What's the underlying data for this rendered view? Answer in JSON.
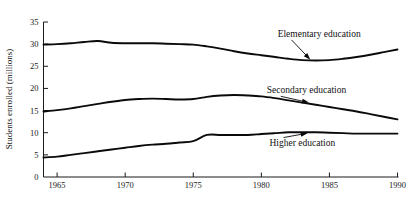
{
  "chart_data": {
    "type": "line",
    "title": "",
    "xlabel": "",
    "ylabel": "Students enrolled (millions)",
    "xlim": [
      1964,
      1990
    ],
    "ylim": [
      0,
      35
    ],
    "grid": false,
    "legend_position": "inline-annotations",
    "x_ticks": [
      "1965",
      "1970",
      "1975",
      "1980",
      "1985",
      "1990"
    ],
    "x_tick_values": [
      1965,
      1970,
      1975,
      1980,
      1985,
      1990
    ],
    "y_ticks": [
      "0",
      "5",
      "10",
      "15",
      "20",
      "25",
      "30",
      "35"
    ],
    "y_tick_values": [
      0,
      5,
      10,
      15,
      20,
      25,
      30,
      35
    ],
    "x": [
      1964,
      1965,
      1966,
      1967,
      1968,
      1969,
      1970,
      1971,
      1972,
      1973,
      1974,
      1975,
      1976,
      1977,
      1978,
      1979,
      1980,
      1981,
      1982,
      1983,
      1984,
      1985,
      1986,
      1987,
      1988,
      1989,
      1990
    ],
    "series": [
      {
        "name": "Elementary education",
        "values": [
          29.9,
          30.0,
          30.2,
          30.5,
          30.7,
          30.3,
          30.2,
          30.2,
          30.2,
          30.1,
          30.0,
          29.9,
          29.5,
          29.0,
          28.4,
          27.9,
          27.5,
          27.1,
          26.7,
          26.4,
          26.3,
          26.4,
          26.7,
          27.1,
          27.6,
          28.2,
          28.8
        ],
        "annotation": {
          "label": "Elementary education",
          "label_x": 1981.2,
          "label_y": 31.6,
          "point_x": 1983.6,
          "point_y": 26.5
        }
      },
      {
        "name": "Secondary education",
        "values": [
          14.8,
          15.1,
          15.5,
          16.0,
          16.5,
          17.0,
          17.4,
          17.6,
          17.7,
          17.6,
          17.5,
          17.6,
          18.1,
          18.4,
          18.5,
          18.4,
          18.2,
          17.8,
          17.3,
          16.8,
          16.3,
          15.8,
          15.3,
          14.8,
          14.2,
          13.6,
          13.0
        ],
        "annotation": {
          "label": "Secondary education",
          "label_x": 1980.4,
          "label_y": 18.9,
          "point_x": 1983.5,
          "point_y": 16.8
        }
      },
      {
        "name": "Higher education",
        "values": [
          4.4,
          4.6,
          5.0,
          5.4,
          5.8,
          6.2,
          6.6,
          7.0,
          7.3,
          7.5,
          7.8,
          8.1,
          9.5,
          9.5,
          9.5,
          9.5,
          9.7,
          9.9,
          10.1,
          10.1,
          10.1,
          10.0,
          9.9,
          9.8,
          9.8,
          9.8,
          9.8
        ],
        "annotation": {
          "label": "Higher education",
          "label_x": 1980.6,
          "label_y": 7.1,
          "point_x": 1983.4,
          "point_y": 9.9
        }
      }
    ]
  }
}
